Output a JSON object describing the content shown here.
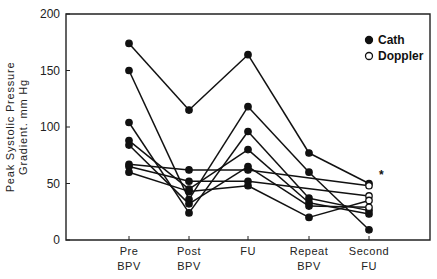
{
  "chart_data": {
    "type": "line",
    "title": "",
    "xlabel": "",
    "ylabel": "Peak Systolic Pressure Gradient. mm Hg",
    "ylabel_lines": [
      "Peak Systolic Pressure",
      "Gradient. mm Hg"
    ],
    "ylim": [
      0,
      200
    ],
    "yticks": [
      0,
      50,
      100,
      150,
      200
    ],
    "categories": [
      "Pre BPV",
      "Post BPV",
      "FU",
      "Repeat BPV",
      "Second FU"
    ],
    "category_lines": [
      [
        "Pre",
        "BPV"
      ],
      [
        "Post",
        "BPV"
      ],
      [
        "FU",
        ""
      ],
      [
        "Repeat",
        "BPV"
      ],
      [
        "Second",
        "FU"
      ]
    ],
    "grid": false,
    "legend_position": "top-right",
    "legend": [
      {
        "label": "Cath",
        "marker": "filled-circle"
      },
      {
        "label": "Doppler",
        "marker": "open-circle"
      }
    ],
    "annotations": [
      {
        "text": "*",
        "x": "Second FU",
        "y": 57
      }
    ],
    "series": [
      {
        "name": "Patient 1",
        "values": [
          174,
          115,
          164,
          77,
          50
        ],
        "markers": [
          "cath",
          "cath",
          "cath",
          "cath",
          "cath"
        ]
      },
      {
        "name": "Patient 2",
        "values": [
          150,
          36,
          118,
          60,
          9
        ],
        "markers": [
          "cath",
          "cath",
          "cath",
          "cath",
          "cath"
        ]
      },
      {
        "name": "Patient 3",
        "values": [
          104,
          24,
          96,
          37,
          26
        ],
        "markers": [
          "cath",
          "cath",
          "cath",
          "cath",
          "cath"
        ]
      },
      {
        "name": "Patient 4",
        "values": [
          88,
          45,
          80,
          33,
          23
        ],
        "markers": [
          "cath",
          "cath",
          "cath",
          "cath",
          "cath"
        ]
      },
      {
        "name": "Patient 5",
        "values": [
          84,
          32,
          65,
          30,
          29
        ],
        "markers": [
          "cath",
          "cath",
          "cath",
          "cath",
          "doppler"
        ]
      },
      {
        "name": "Patient 6",
        "values": [
          67,
          62,
          62,
          null,
          48
        ],
        "markers": [
          "cath",
          "cath",
          "cath",
          null,
          "doppler"
        ]
      },
      {
        "name": "Patient 7",
        "values": [
          65,
          52,
          52,
          null,
          39
        ],
        "markers": [
          "cath",
          "cath",
          "cath",
          null,
          "doppler"
        ]
      },
      {
        "name": "Patient 8",
        "values": [
          60,
          43,
          48,
          20,
          35
        ],
        "markers": [
          "cath",
          "cath",
          "cath",
          "cath",
          "doppler"
        ]
      }
    ]
  },
  "colors": {
    "line": "#111111",
    "axis": "#222222",
    "background": "#ffffff"
  }
}
